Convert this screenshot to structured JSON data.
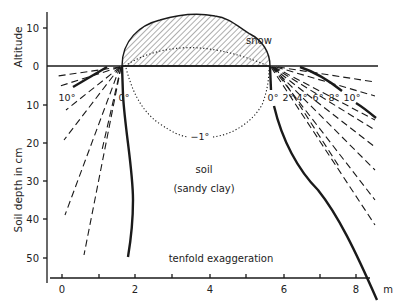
{
  "figure": {
    "title": "",
    "caption_note": "tenfold exaggeration",
    "y_axis": {
      "upper_title": "Altitude",
      "lower_title": "Soil depth in cm",
      "upper_ticks": [
        "10",
        "0"
      ],
      "lower_ticks": [
        "10",
        "20",
        "30",
        "40",
        "50"
      ]
    },
    "x_axis": {
      "unit": "m",
      "tick_labels": [
        "0",
        "2",
        "4",
        "6",
        "8"
      ],
      "minor_ticks": [
        "1",
        "3",
        "5",
        "7"
      ]
    },
    "regions": {
      "snow": "snow",
      "soil": "soil",
      "soil_type": "(sandy clay)"
    },
    "isotherms": {
      "left_labels": [
        "10°",
        "0°"
      ],
      "right_labels": [
        "0°",
        "2°",
        "4°",
        "6°",
        "8°",
        "10°"
      ],
      "inner_label": "−1°"
    },
    "colors": {
      "ink": "#1a1a1a",
      "background": "#ffffff"
    }
  }
}
